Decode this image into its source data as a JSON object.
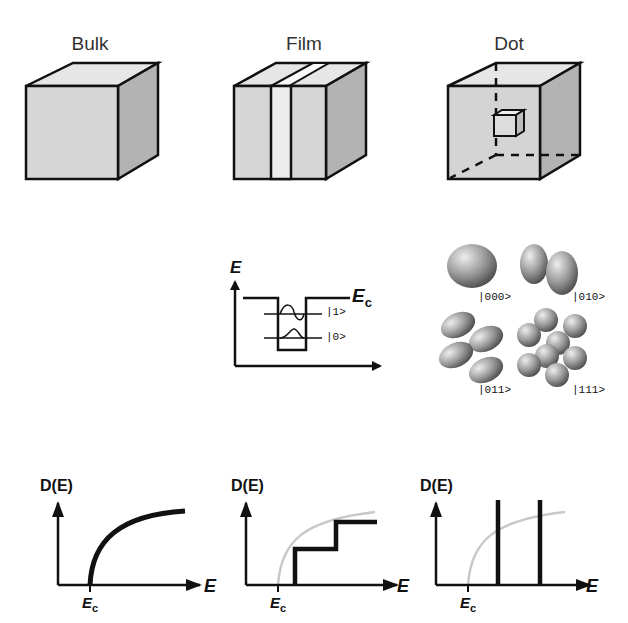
{
  "columns": [
    {
      "title": "Bulk"
    },
    {
      "title": "Film"
    },
    {
      "title": "Dot"
    }
  ],
  "energy_diagram": {
    "axis_label": "E",
    "band_edge_label": "E",
    "band_edge_sub": "c",
    "states": [
      "|1>",
      "|0>"
    ]
  },
  "wavefunctions": {
    "states": [
      "|000>",
      "|010>",
      "|011>",
      "|111>"
    ]
  },
  "dos_plots": [
    {
      "ylabel": "D(E)",
      "xlabel": "E",
      "edge_label": "E",
      "edge_sub": "c",
      "shape": "sqrt"
    },
    {
      "ylabel": "D(E)",
      "xlabel": "E",
      "edge_label": "E",
      "edge_sub": "c",
      "shape": "staircase"
    },
    {
      "ylabel": "D(E)",
      "xlabel": "E",
      "edge_label": "E",
      "edge_sub": "c",
      "shape": "delta"
    }
  ],
  "colors": {
    "line": "#111111",
    "face_front": "#d6d6d6",
    "face_top": "#e6e6e6",
    "face_side": "#b3b3b3",
    "ghost_curve": "#c8c8c8"
  }
}
